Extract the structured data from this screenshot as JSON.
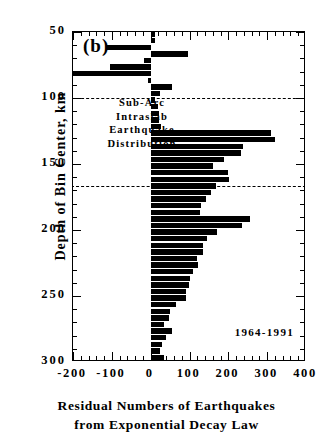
{
  "figure": {
    "panel_label": "(b)",
    "years_annotation": "1964-1991",
    "caption_lines": [
      "Sub-Arc",
      "Intraslab",
      "Earthquake",
      "Distribution"
    ],
    "y_axis_title": "Depth of Bin Center, km",
    "x_axis_title_line1": "Residual Numbers of Earthquakes",
    "x_axis_title_line2": "from Exponential Decay Law"
  },
  "chart_data": {
    "type": "bar",
    "orientation": "horizontal",
    "title": "(b) Sub-Arc Intraslab Earthquake Distribution",
    "xlabel": "Residual Numbers of Earthquakes from Exponential Decay Law",
    "ylabel": "Depth of Bin Center, km",
    "xlim": [
      -200,
      400
    ],
    "ylim": [
      50,
      300
    ],
    "y_inverted": true,
    "grid": false,
    "legend": null,
    "x_ticks_major": [
      -200,
      -100,
      0,
      100,
      200,
      300,
      400
    ],
    "x_tick_labels": [
      "-200",
      "-100",
      "0",
      "100",
      "200",
      "300",
      "400"
    ],
    "x_tick_minor_step": 20,
    "y_ticks_major": [
      50,
      100,
      150,
      200,
      250,
      300
    ],
    "y_tick_labels": [
      "50",
      "100",
      "150",
      "200",
      "250",
      "300"
    ],
    "y_tick_minor_step": 10,
    "reference_lines": [
      {
        "axis": "y",
        "value": 100,
        "style": "dashed"
      },
      {
        "axis": "y",
        "value": 167,
        "style": "dashed"
      }
    ],
    "annotations": [
      {
        "text": "(b)",
        "x": -175,
        "y": 57
      },
      {
        "text": "1964-1991",
        "x": 245,
        "y": 283
      },
      {
        "text": "Sub-Arc",
        "x": -110,
        "y": 113
      },
      {
        "text": "Intraslab",
        "x": -110,
        "y": 126
      },
      {
        "text": "Earthquake",
        "x": -110,
        "y": 139
      },
      {
        "text": "Distribution",
        "x": -110,
        "y": 152
      }
    ],
    "bin_width_km": 5,
    "categories": [
      52,
      57,
      62,
      67,
      72,
      77,
      82,
      87,
      92,
      97,
      102,
      107,
      112,
      117,
      122,
      127,
      132,
      137,
      142,
      147,
      152,
      157,
      162,
      167,
      172,
      177,
      182,
      187,
      192,
      197,
      202,
      207,
      212,
      217,
      222,
      227,
      232,
      237,
      242,
      247,
      252,
      257,
      262,
      267,
      272,
      277,
      282,
      287,
      292,
      297
    ],
    "values": [
      10,
      12,
      -112,
      95,
      -18,
      -105,
      -200,
      -8,
      55,
      25,
      12,
      18,
      22,
      22,
      26,
      310,
      320,
      238,
      232,
      190,
      160,
      200,
      202,
      168,
      155,
      142,
      130,
      128,
      255,
      235,
      172,
      145,
      135,
      135,
      120,
      122,
      110,
      102,
      100,
      92,
      90,
      65,
      50,
      48,
      35,
      55,
      40,
      28,
      25,
      35
    ],
    "value_units": "residual number of earthquakes"
  }
}
